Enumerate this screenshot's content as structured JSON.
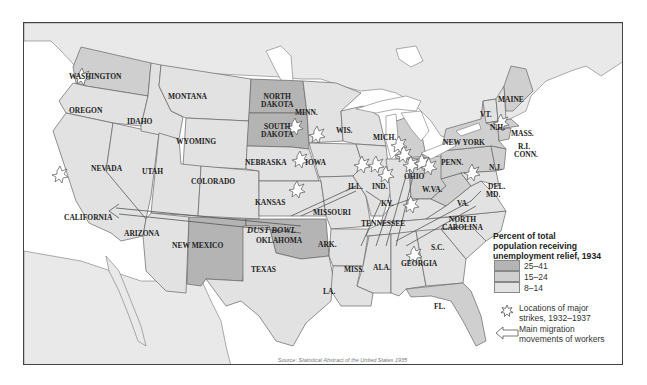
{
  "map": {
    "title": "Percent of total population receiving unemployment relief, 1934",
    "title_lines": [
      "Percent of total",
      "population receiving",
      "unemployment relief, 1934"
    ],
    "colors": {
      "high": "#b4b4b4",
      "medium": "#cfcfcf",
      "low": "#e2e2e2",
      "water": "#ffffff",
      "foreign_land": "#e8e8e8",
      "border": "#666666"
    },
    "legend": {
      "ranges": [
        {
          "label": "25–41",
          "shade": "high"
        },
        {
          "label": "15–24",
          "shade": "medium"
        },
        {
          "label": "8–14",
          "shade": "low"
        }
      ],
      "strikes_icon": "strike-burst-icon",
      "strikes_label_lines": [
        "Locations of major",
        "strikes, 1932–1937"
      ],
      "migration_icon": "migration-arrow-icon",
      "migration_label_lines": [
        "Main migration",
        "movements of workers"
      ]
    },
    "region_label": "DUST BOWL",
    "states": [
      {
        "name": "WASHINGTON",
        "shade": "medium"
      },
      {
        "name": "OREGON",
        "shade": "low"
      },
      {
        "name": "IDAHO",
        "shade": "low"
      },
      {
        "name": "MONTANA",
        "shade": "low"
      },
      {
        "name": "NORTH DAKOTA",
        "shade": "high"
      },
      {
        "name": "SOUTH DAKOTA",
        "shade": "high"
      },
      {
        "name": "MINN.",
        "shade": "low"
      },
      {
        "name": "WIS.",
        "shade": "low"
      },
      {
        "name": "MICH.",
        "shade": "medium"
      },
      {
        "name": "WYOMING",
        "shade": "low"
      },
      {
        "name": "NEBRASKA",
        "shade": "low"
      },
      {
        "name": "IOWA",
        "shade": "low"
      },
      {
        "name": "NEVADA",
        "shade": "low"
      },
      {
        "name": "UTAH",
        "shade": "low"
      },
      {
        "name": "COLORADO",
        "shade": "low"
      },
      {
        "name": "KANSAS",
        "shade": "low"
      },
      {
        "name": "ILL.",
        "shade": "low"
      },
      {
        "name": "IND.",
        "shade": "low"
      },
      {
        "name": "OHIO",
        "shade": "medium"
      },
      {
        "name": "CALIFORNIA",
        "shade": "low"
      },
      {
        "name": "ARIZONA",
        "shade": "low"
      },
      {
        "name": "NEW MEXICO",
        "shade": "high"
      },
      {
        "name": "OKLAHOMA",
        "shade": "high"
      },
      {
        "name": "MISSOURI",
        "shade": "low"
      },
      {
        "name": "KY.",
        "shade": "low"
      },
      {
        "name": "W.VA.",
        "shade": "medium"
      },
      {
        "name": "TENNESSEE",
        "shade": "low"
      },
      {
        "name": "ARK.",
        "shade": "low"
      },
      {
        "name": "TEXAS",
        "shade": "low"
      },
      {
        "name": "MISS.",
        "shade": "low"
      },
      {
        "name": "ALA.",
        "shade": "low"
      },
      {
        "name": "GEORGIA",
        "shade": "low"
      },
      {
        "name": "LA.",
        "shade": "low"
      },
      {
        "name": "FL.",
        "shade": "medium"
      },
      {
        "name": "S.C.",
        "shade": "low"
      },
      {
        "name": "NORTH CAROLINA",
        "shade": "low"
      },
      {
        "name": "VA.",
        "shade": "low"
      },
      {
        "name": "PENN.",
        "shade": "medium"
      },
      {
        "name": "NEW YORK",
        "shade": "medium"
      },
      {
        "name": "N.J.",
        "shade": "medium"
      },
      {
        "name": "DEL.",
        "shade": "low"
      },
      {
        "name": "MD.",
        "shade": "low"
      },
      {
        "name": "VT.",
        "shade": "low"
      },
      {
        "name": "N.H.",
        "shade": "low"
      },
      {
        "name": "MAINE",
        "shade": "medium"
      },
      {
        "name": "MASS.",
        "shade": "medium"
      },
      {
        "name": "R.I.",
        "shade": "medium"
      },
      {
        "name": "CONN.",
        "shade": "medium"
      }
    ],
    "labels": {
      "washington": "WASHINGTON",
      "oregon": "OREGON",
      "idaho": "IDAHO",
      "montana": "MONTANA",
      "north_dakota_1": "NORTH",
      "north_dakota_2": "DAKOTA",
      "south_dakota_1": "SOUTH",
      "south_dakota_2": "DAKOTA",
      "minn": "MINN.",
      "wis": "WIS.",
      "mich": "MICH.",
      "wyoming": "WYOMING",
      "nebraska": "NEBRASKA",
      "iowa": "IOWA",
      "nevada": "NEVADA",
      "utah": "UTAH",
      "colorado": "COLORADO",
      "kansas": "KANSAS",
      "ill": "ILL.",
      "ind": "IND.",
      "ohio": "OHIO",
      "california": "CALIFORNIA",
      "arizona": "ARIZONA",
      "new_mexico": "NEW MEXICO",
      "oklahoma": "OKLAHOMA",
      "missouri": "MISSOURI",
      "ky": "KY.",
      "wva": "W.VA.",
      "tennessee": "TENNESSEE",
      "ark": "ARK.",
      "texas": "TEXAS",
      "miss": "MISS.",
      "ala": "ALA.",
      "georgia": "GEORGIA",
      "la": "LA.",
      "fl": "FL.",
      "sc": "S.C.",
      "north_carolina_1": "NORTH",
      "north_carolina_2": "CAROLINA",
      "va": "VA.",
      "penn": "PENN.",
      "new_york": "NEW YORK",
      "nj": "N.J.",
      "del": "DEL.",
      "md": "MD.",
      "vt": "VT.",
      "nh": "N.H.",
      "maine": "MAINE",
      "mass": "MASS.",
      "ri": "R.I.",
      "conn": "CONN."
    },
    "strike_locations": [
      "Minnesota",
      "Wisconsin",
      "Iowa",
      "Kansas",
      "Illinois",
      "Indiana (2)",
      "Michigan (3)",
      "Ohio (3)",
      "Kentucky",
      "Pennsylvania",
      "Georgia",
      "Washington",
      "California"
    ],
    "migration_routes": [
      "Dust Bowl (Oklahoma/Texas) west to California",
      "South to Midwest industrial cities (Illinois)",
      "South to Indiana/Ohio/Michigan",
      "Southeast to Northeast (Virginia/Maryland)"
    ],
    "source_prefix": "Source:",
    "source_title": "Statistical Abstract of the United States 1935"
  }
}
